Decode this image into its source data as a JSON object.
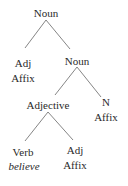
{
  "diagram": {
    "type": "morphology-tree",
    "nodes": [
      {
        "id": "root",
        "label": "Noun"
      },
      {
        "id": "adj1",
        "label": "Adj",
        "sub": "Affix"
      },
      {
        "id": "noun2",
        "label": "Noun"
      },
      {
        "id": "adjective",
        "label": "Adjective"
      },
      {
        "id": "n",
        "label": "N",
        "sub": "Affix"
      },
      {
        "id": "verb",
        "label": "Verb",
        "sub": "believe"
      },
      {
        "id": "adj2",
        "label": "Adj",
        "sub": "Affix"
      }
    ],
    "edges": [
      [
        "root",
        "adj1"
      ],
      [
        "root",
        "noun2"
      ],
      [
        "noun2",
        "adjective"
      ],
      [
        "noun2",
        "n"
      ],
      [
        "adjective",
        "verb"
      ],
      [
        "adjective",
        "adj2"
      ]
    ]
  }
}
